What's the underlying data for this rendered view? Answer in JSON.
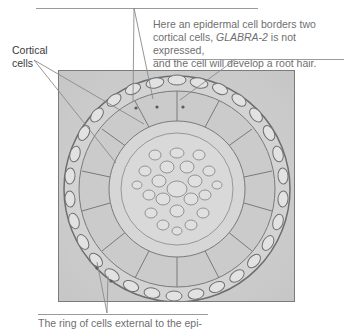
{
  "figure": {
    "top_caption_partial": "",
    "labels": {
      "cortical": "Cortical cells",
      "cortical_line1": "Cortical",
      "cortical_line2": "cells",
      "root_hair_line1": "Here an epidermal cell borders two",
      "root_hair_line2_pre": "cortical cells, ",
      "root_hair_line2_gene": "GLABRA-2",
      "root_hair_line2_post": " is not expressed,",
      "root_hair_line3": "and the cell will develop a root hair.",
      "bottom_line1": "The ring of cells external to the epi-"
    },
    "image": {
      "description": "Light micrograph of a root cross-section showing concentric rings of cells",
      "colors": {
        "background": "#cfcfcf",
        "cell_fill": "#d9d9d9",
        "cell_wall": "#8a8a8a"
      }
    },
    "colors": {
      "label_text": "#6f6f6f",
      "dark_label_text": "#3a3a3a",
      "leader_line": "#8a8a8a"
    }
  }
}
